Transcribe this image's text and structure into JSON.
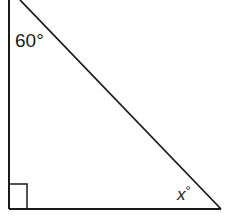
{
  "diagram": {
    "type": "right-triangle",
    "angles": {
      "top": "60°",
      "bottom_right": "x°",
      "bottom_left": "right-angle"
    },
    "labels": {
      "top_angle": "60°",
      "bottom_right_angle_var": "x",
      "bottom_right_angle_deg": "°"
    },
    "stroke_color": "#1a1a1a",
    "background": "#ffffff"
  }
}
